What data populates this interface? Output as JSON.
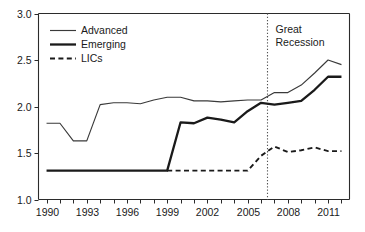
{
  "chart_data": {
    "type": "line",
    "title": "",
    "subtitle": "",
    "xlabel": "",
    "ylabel": "",
    "xlim": [
      1989.4,
      2012.6
    ],
    "ylim": [
      1.0,
      3.0
    ],
    "grid": false,
    "legend_position": "top-left",
    "x": [
      1990,
      1991,
      1992,
      1993,
      1994,
      1995,
      1996,
      1997,
      1998,
      1999,
      2000,
      2001,
      2002,
      2003,
      2004,
      2005,
      2006,
      2007,
      2008,
      2009,
      2010,
      2011,
      2012
    ],
    "xtick_values": [
      1990,
      1993,
      1996,
      1999,
      2002,
      2005,
      2008,
      2011
    ],
    "xtick_labels": [
      "1990",
      "1993",
      "1996",
      "1999",
      "2002",
      "2005",
      "2008",
      "2011"
    ],
    "xtick_minor_values": [
      1991,
      1992,
      1994,
      1995,
      1997,
      1998,
      2000,
      2001,
      2003,
      2004,
      2006,
      2007,
      2009,
      2010,
      2012
    ],
    "ytick_values": [
      1.0,
      1.5,
      2.0,
      2.5,
      3.0
    ],
    "ytick_labels": [
      "1.0",
      "1.5",
      "2.0",
      "2.5",
      "3.0"
    ],
    "series": [
      {
        "name": "Advanced",
        "style": "solid-thin",
        "color": "#3a3a3a",
        "x": [
          1990,
          1991,
          1992,
          1993,
          1994,
          1995,
          1996,
          1997,
          1998,
          1999,
          2000,
          2001,
          2002,
          2003,
          2004,
          2005,
          2006,
          2007,
          2008,
          2009,
          2010,
          2011,
          2012
        ],
        "values": [
          1.82,
          1.82,
          1.63,
          1.63,
          2.02,
          2.04,
          2.04,
          2.03,
          2.07,
          2.1,
          2.1,
          2.06,
          2.06,
          2.05,
          2.06,
          2.07,
          2.07,
          2.15,
          2.15,
          2.23,
          2.36,
          2.5,
          2.45
        ]
      },
      {
        "name": "Emerging",
        "style": "solid-thick",
        "color": "#1a1a1a",
        "x": [
          1990,
          1991,
          1992,
          1993,
          1994,
          1995,
          1996,
          1997,
          1998,
          1999,
          2000,
          2001,
          2002,
          2003,
          2004,
          2005,
          2006,
          2007,
          2008,
          2009,
          2010,
          2011,
          2012
        ],
        "values": [
          1.31,
          1.31,
          1.31,
          1.31,
          1.31,
          1.31,
          1.31,
          1.31,
          1.31,
          1.31,
          1.83,
          1.82,
          1.88,
          1.86,
          1.83,
          1.95,
          2.04,
          2.02,
          2.04,
          2.06,
          2.18,
          2.32,
          2.32
        ]
      },
      {
        "name": "LICs",
        "style": "dashed",
        "color": "#1a1a1a",
        "x": [
          1999,
          2000,
          2001,
          2002,
          2003,
          2004,
          2005,
          2006,
          2007,
          2008,
          2009,
          2010,
          2011,
          2012
        ],
        "values": [
          1.31,
          1.31,
          1.31,
          1.31,
          1.31,
          1.31,
          1.31,
          1.47,
          1.57,
          1.51,
          1.53,
          1.56,
          1.52,
          1.52
        ]
      }
    ],
    "annotations": [
      {
        "name": "great-recession",
        "lines": [
          "Great",
          "Recession"
        ],
        "x": 2006.45,
        "marker": "vertical-dotted-line"
      }
    ]
  },
  "legend": {
    "items": [
      {
        "label": "Advanced"
      },
      {
        "label": "Emerging"
      },
      {
        "label": "LICs"
      }
    ]
  }
}
